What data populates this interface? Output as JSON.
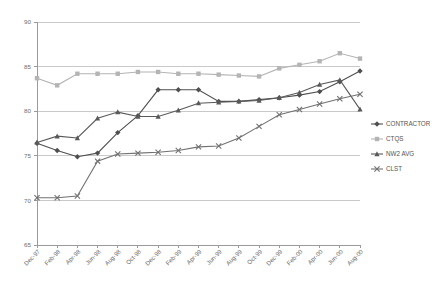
{
  "chart_data": {
    "type": "line",
    "title": "",
    "subtitle": "",
    "xlabel": "",
    "ylabel": "",
    "ylim": [
      65,
      90
    ],
    "yticks": [
      65,
      70,
      75,
      80,
      85,
      90
    ],
    "grid": true,
    "legend_position": "right",
    "categories": [
      "Dec-97",
      "Feb-98",
      "Apr-98",
      "Jun-98",
      "Aug-98",
      "Oct-98",
      "Dec-98",
      "Feb-99",
      "Apr-99",
      "Jun-99",
      "Aug-99",
      "Oct-99",
      "Dec-99",
      "Feb-00",
      "Apr-00",
      "Jun-00",
      "Aug-00"
    ],
    "series": [
      {
        "name": "CONTRACTOR",
        "color": "#4f4f4f",
        "marker": "diamond",
        "values": [
          76.4,
          75.6,
          74.9,
          75.3,
          77.6,
          79.5,
          82.4,
          82.4,
          82.4,
          81.1,
          81.1,
          81.3,
          81.5,
          81.8,
          82.2,
          83.3,
          84.5
        ]
      },
      {
        "name": "CTQS",
        "color": "#b4b4b4",
        "marker": "square",
        "values": [
          83.7,
          82.9,
          84.2,
          84.2,
          84.2,
          84.4,
          84.4,
          84.2,
          84.2,
          84.1,
          84.0,
          83.9,
          84.8,
          85.2,
          85.6,
          86.5,
          85.9
        ]
      },
      {
        "name": "NW2 AVG",
        "color": "#595959",
        "marker": "triangle",
        "values": [
          76.5,
          77.2,
          77.0,
          79.2,
          79.9,
          79.4,
          79.4,
          80.1,
          80.9,
          81.0,
          81.1,
          81.2,
          81.5,
          82.1,
          83.0,
          83.5,
          80.2
        ]
      },
      {
        "name": "CLST",
        "color": "#717171",
        "marker": "cross",
        "values": [
          70.3,
          70.3,
          70.5,
          74.4,
          75.2,
          75.3,
          75.4,
          75.6,
          76.0,
          76.1,
          77.0,
          78.3,
          79.6,
          80.2,
          80.8,
          81.4,
          81.9
        ]
      }
    ]
  },
  "legend": {
    "items": [
      {
        "label": "CONTRACTOR"
      },
      {
        "label": "CTQS"
      },
      {
        "label": "NW2 AVG"
      },
      {
        "label": "CLST"
      }
    ]
  }
}
